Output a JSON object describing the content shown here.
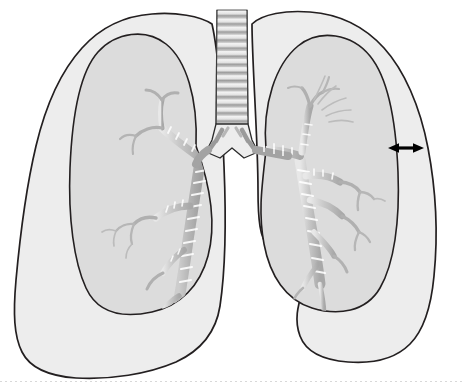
{
  "figure": {
    "caption": "",
    "view": "anterior",
    "background_color": "#ffffff",
    "outline_color": "#231f20",
    "pleural_fill_color": "#ececec",
    "lung_fill_color": "#dcdcdc",
    "airway_fill_color": "#d2d2d2",
    "airway_stroke_color": "#9a9a9a",
    "annotation_color": "#000000"
  },
  "structures": {
    "trachea": {
      "label": "trachea",
      "ring_count": 14,
      "top_y": 10,
      "bottom_y": 124,
      "left_x": 216,
      "right_x": 248
    },
    "carina": {
      "label": "carina",
      "x": 232,
      "y": 152
    },
    "left_lung": {
      "label": "left lung (viewer right)",
      "side": "anatomical-left",
      "state": "collapsed",
      "has_pneumothorax": true,
      "pleural_outline": "outer chest wall / parietal pleura",
      "lung_outline": "visceral pleura of collapsed lung"
    },
    "right_lung": {
      "label": "right lung (viewer left)",
      "side": "anatomical-right",
      "state": "normal",
      "has_pneumothorax": false,
      "pleural_outline": "outer chest wall / parietal pleura",
      "lung_outline": "visceral pleura"
    },
    "bronchial_tree_left": {
      "label": "bronchial tree, viewer-left lung"
    },
    "bronchial_tree_right": {
      "label": "bronchial tree, viewer-right lung"
    }
  },
  "annotations": {
    "gap_arrow": {
      "name": "pneumothorax-gap-arrow",
      "type": "double-headed-arrow",
      "label": "",
      "x_start": 388,
      "x_end": 424,
      "y": 148,
      "meaning": "air gap between collapsed lung surface and chest wall"
    }
  },
  "bottom_rule": {
    "visible": true,
    "style": "dotted",
    "color": "#d8d8d8"
  }
}
